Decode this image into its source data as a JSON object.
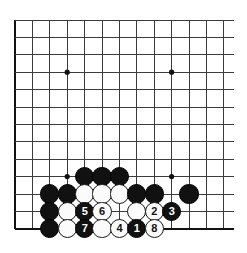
{
  "figure": {
    "type": "go-board-diagram",
    "title": "",
    "background_color": "#ffffff",
    "line_color": "#3b3b3b",
    "edge_color": "#111111",
    "black_stone_color": "#111111",
    "white_stone_color": "#fbfbfb"
  },
  "board": {
    "origin_x": 15,
    "origin_y": 20,
    "spacing": 17.4,
    "cols": 13,
    "rows": 13,
    "stone_radius": 9.6,
    "edges": {
      "left": true,
      "bottom": true,
      "top": false,
      "right": false
    },
    "star_points": [
      {
        "col": 3,
        "row": 3
      },
      {
        "col": 9,
        "row": 3
      },
      {
        "col": 3,
        "row": 9
      },
      {
        "col": 9,
        "row": 9
      }
    ]
  },
  "stones": [
    {
      "id": "b-c4-r9",
      "color": "black",
      "col": 4,
      "row": 9,
      "label": ""
    },
    {
      "id": "b-c5-r9",
      "color": "black",
      "col": 5,
      "row": 9,
      "label": ""
    },
    {
      "id": "b-c6-r9",
      "color": "black",
      "col": 6,
      "row": 9,
      "label": ""
    },
    {
      "id": "b-c2-r10",
      "color": "black",
      "col": 2,
      "row": 10,
      "label": ""
    },
    {
      "id": "b-c3-r10",
      "color": "black",
      "col": 3,
      "row": 10,
      "label": ""
    },
    {
      "id": "w-c4-r10",
      "color": "white",
      "col": 4,
      "row": 10,
      "label": ""
    },
    {
      "id": "w-c5-r10",
      "color": "white",
      "col": 5,
      "row": 10,
      "label": ""
    },
    {
      "id": "w-c6-r10",
      "color": "white",
      "col": 6,
      "row": 10,
      "label": ""
    },
    {
      "id": "b-c7-r10",
      "color": "black",
      "col": 7,
      "row": 10,
      "label": ""
    },
    {
      "id": "b-c8-r10",
      "color": "black",
      "col": 8,
      "row": 10,
      "label": ""
    },
    {
      "id": "b-c10-r10",
      "color": "black",
      "col": 10,
      "row": 10,
      "label": ""
    },
    {
      "id": "b-c2-r11",
      "color": "black",
      "col": 2,
      "row": 11,
      "label": ""
    },
    {
      "id": "w-c3-r11",
      "color": "white",
      "col": 3,
      "row": 11,
      "label": ""
    },
    {
      "id": "b-c4-r11",
      "color": "black",
      "col": 4,
      "row": 11,
      "label": "5"
    },
    {
      "id": "w-c5-r11",
      "color": "white",
      "col": 5,
      "row": 11,
      "label": "6"
    },
    {
      "id": "w-c7-r11",
      "color": "white",
      "col": 7,
      "row": 11,
      "label": ""
    },
    {
      "id": "w-c8-r11",
      "color": "white",
      "col": 8,
      "row": 11,
      "label": "2"
    },
    {
      "id": "b-c9-r11",
      "color": "black",
      "col": 9,
      "row": 11,
      "label": "3"
    },
    {
      "id": "b-c2-r12",
      "color": "black",
      "col": 2,
      "row": 12,
      "label": ""
    },
    {
      "id": "w-c3-r12",
      "color": "white",
      "col": 3,
      "row": 12,
      "label": ""
    },
    {
      "id": "b-c4-r12",
      "color": "black",
      "col": 4,
      "row": 12,
      "label": "7"
    },
    {
      "id": "w-c5-r12",
      "color": "white",
      "col": 5,
      "row": 12,
      "label": ""
    },
    {
      "id": "w-c6-r12",
      "color": "white",
      "col": 6,
      "row": 12,
      "label": "4"
    },
    {
      "id": "b-c7-r12",
      "color": "black",
      "col": 7,
      "row": 12,
      "label": "1"
    },
    {
      "id": "w-c8-r12",
      "color": "white",
      "col": 8,
      "row": 12,
      "label": "8"
    }
  ],
  "move_sequence": [
    {
      "number": "1",
      "color": "black"
    },
    {
      "number": "2",
      "color": "white"
    },
    {
      "number": "3",
      "color": "black"
    },
    {
      "number": "4",
      "color": "white"
    },
    {
      "number": "5",
      "color": "black"
    },
    {
      "number": "6",
      "color": "white"
    },
    {
      "number": "7",
      "color": "black"
    },
    {
      "number": "8",
      "color": "white"
    }
  ]
}
